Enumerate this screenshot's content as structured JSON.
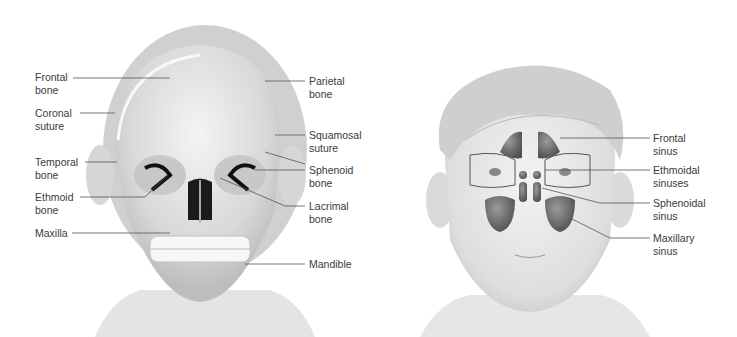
{
  "figure": {
    "panels": [
      {
        "name": "skull-anterior-view",
        "labels": [
          {
            "id": "frontal-bone",
            "lines": [
              "Frontal",
              "bone"
            ],
            "side": "left"
          },
          {
            "id": "coronal-suture",
            "lines": [
              "Coronal",
              "suture"
            ],
            "side": "left"
          },
          {
            "id": "temporal-bone",
            "lines": [
              "Temporal",
              "bone"
            ],
            "side": "left"
          },
          {
            "id": "ethmoid-bone",
            "lines": [
              "Ethmoid",
              "bone"
            ],
            "side": "left"
          },
          {
            "id": "maxilla",
            "lines": [
              "Maxilla"
            ],
            "side": "left"
          },
          {
            "id": "parietal-bone",
            "lines": [
              "Parietal",
              "bone"
            ],
            "side": "right"
          },
          {
            "id": "squamosal-suture",
            "lines": [
              "Squamosal",
              "suture"
            ],
            "side": "right"
          },
          {
            "id": "sphenoid-bone",
            "lines": [
              "Sphenoid",
              "bone"
            ],
            "side": "right"
          },
          {
            "id": "lacrimal-bone",
            "lines": [
              "Lacrimal",
              "bone"
            ],
            "side": "right"
          },
          {
            "id": "mandible",
            "lines": [
              "Mandible"
            ],
            "side": "right"
          }
        ]
      },
      {
        "name": "paranasal-sinuses-view",
        "labels": [
          {
            "id": "frontal-sinus",
            "lines": [
              "Frontal",
              "sinus"
            ],
            "side": "right"
          },
          {
            "id": "ethmoidal-sinuses",
            "lines": [
              "Ethmoidal",
              "sinuses"
            ],
            "side": "right"
          },
          {
            "id": "sphenoidal-sinus",
            "lines": [
              "Sphenoidal",
              "sinus"
            ],
            "side": "right"
          },
          {
            "id": "maxillary-sinus",
            "lines": [
              "Maxillary",
              "sinus"
            ],
            "side": "right"
          }
        ]
      }
    ],
    "colors": {
      "text": "#3a3a3a",
      "leader": "#555555",
      "bone": "#dcdcdc",
      "sinus": "#6e6e6e",
      "skin": "#e6e6e6"
    }
  }
}
